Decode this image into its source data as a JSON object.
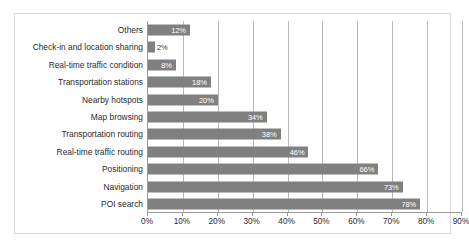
{
  "chart_data": {
    "type": "bar",
    "orientation": "horizontal",
    "title": "",
    "subtitle": "",
    "xlabel": "",
    "ylabel": "",
    "xlim": [
      0,
      90
    ],
    "xtick_labels": [
      "0%",
      "10%",
      "20%",
      "30%",
      "40%",
      "50%",
      "60%",
      "70%",
      "80%",
      "90%"
    ],
    "xtick_values": [
      0,
      10,
      20,
      30,
      40,
      50,
      60,
      70,
      80,
      90
    ],
    "grid": "vertical",
    "legend": "none",
    "bar_color": "#808080",
    "label_color": "#ffffff",
    "categories": [
      "Others",
      "Check-in and location sharing",
      "Real-time traffic condition",
      "Transportation stations",
      "Nearby hotspots",
      "Map browsing",
      "Transportation routing",
      "Real-time traffic routing",
      "Positioning",
      "Navigation",
      "POI search"
    ],
    "values": [
      12,
      2,
      8,
      18,
      20,
      34,
      38,
      46,
      66,
      73,
      78
    ],
    "data_labels": [
      "12%",
      "2%",
      "8%",
      "18%",
      "20%",
      "34%",
      "38%",
      "46%",
      "66%",
      "73%",
      "78%"
    ],
    "label_placement": [
      "inside",
      "outside",
      "inside",
      "inside",
      "inside",
      "inside",
      "inside",
      "inside",
      "inside",
      "inside",
      "inside"
    ]
  }
}
